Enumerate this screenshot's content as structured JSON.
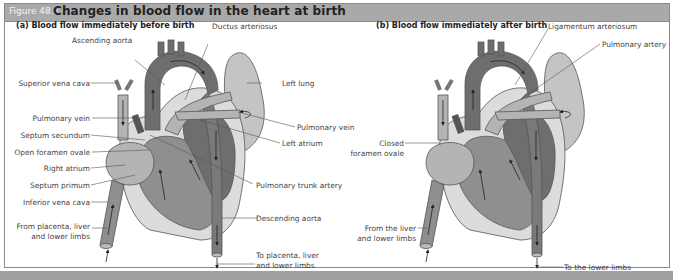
{
  "figure": {
    "number": "Figure 48.1",
    "title": "Changes in blood flow in the heart at birth"
  },
  "panel_a": {
    "title": "(a) Blood flow immediately before birth",
    "labels": {
      "ascending_aorta": "Ascending aorta",
      "ductus_arteriosus": "Ductus arteriosus",
      "left_lung": "Left lung",
      "superior_vena_cava": "Superior vena cava",
      "pulmonary_vein_left": "Pulmonary vein",
      "septum_secundum": "Septum secundum",
      "open_foramen_ovale": "Open foramen ovale",
      "right_atrium": "Right atrium",
      "septum_primum": "Septum primum",
      "inferior_vena_cava": "Inferior vena cava",
      "from_placenta_1": "From placenta, liver",
      "from_placenta_2": "and lower limbs",
      "pulmonary_vein_right": "Pulmonary vein",
      "left_atrium": "Left atrium",
      "pulmonary_trunk_artery": "Pulmonary trunk artery",
      "descending_aorta": "Descending aorta",
      "to_placenta_1": "To placenta, liver",
      "to_placenta_2": "and lower limbs"
    }
  },
  "panel_b": {
    "title": "(b) Blood flow immediately after birth",
    "labels": {
      "ligamentum_arteriosum": "Ligamentum arteriosum",
      "pulmonary_artery": "Pulmonary artery",
      "closed_1": "Closed",
      "closed_2": "foramen ovale",
      "from_liver_1": "From the liver",
      "from_liver_2": "and lower limbs",
      "to_lower_limbs": "To the lower limbs"
    }
  },
  "colors": {
    "header_bg": "#a9a9a9",
    "dark_heart": "#6e6e6e",
    "mid_heart": "#8f8f8f",
    "light_heart": "#b4b4b4",
    "lung": "#c4c4c4",
    "pale_wall": "#dcdcdc"
  }
}
